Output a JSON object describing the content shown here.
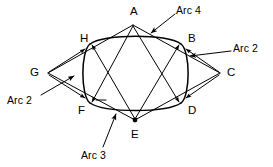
{
  "figure": {
    "kind": "geometric-construction-diagram",
    "stroke_color": "#000000",
    "background_color": "#ffffff",
    "line_width_px": 1
  },
  "points": [
    {
      "id": "A",
      "label": "A",
      "role": "rhombus-vertex-top",
      "x": 133,
      "y": 25,
      "label_x": 130,
      "label_y": 6,
      "dot": false
    },
    {
      "id": "B",
      "label": "B",
      "role": "tangent-point-upper-right",
      "x": 181,
      "y": 44,
      "label_x": 188,
      "label_y": 33,
      "dot": false
    },
    {
      "id": "C",
      "label": "C",
      "role": "rhombus-vertex-right",
      "x": 220,
      "y": 73,
      "label_x": 227,
      "label_y": 67,
      "dot": false
    },
    {
      "id": "D",
      "label": "D",
      "role": "tangent-point-lower-right",
      "x": 181,
      "y": 103,
      "label_x": 188,
      "label_y": 105,
      "dot": false
    },
    {
      "id": "E",
      "label": "E",
      "role": "arc-center-bottom",
      "x": 135,
      "y": 120,
      "label_x": 131,
      "label_y": 129,
      "dot": true
    },
    {
      "id": "F",
      "label": "F",
      "role": "tangent-point-lower-left",
      "x": 90,
      "y": 103,
      "label_x": 78,
      "label_y": 105,
      "dot": false
    },
    {
      "id": "G",
      "label": "G",
      "role": "rhombus-vertex-left",
      "x": 48,
      "y": 73,
      "label_x": 30,
      "label_y": 67,
      "dot": false
    },
    {
      "id": "H",
      "label": "H",
      "role": "tangent-point-upper-left",
      "x": 90,
      "y": 44,
      "label_x": 80,
      "label_y": 33,
      "dot": false
    }
  ],
  "arc_labels": [
    {
      "id": "arc4",
      "label": "Arc 4",
      "label_x": 176,
      "label_y": 5,
      "leader_from": [
        175,
        14
      ],
      "leader_to": [
        151,
        32
      ],
      "arrow": true
    },
    {
      "id": "arc2r",
      "label": "Arc 2",
      "label_x": 233,
      "label_y": 43,
      "leader_from": [
        231,
        52
      ],
      "leader_to": [
        190,
        55
      ],
      "arrow": true
    },
    {
      "id": "arc2l",
      "label": "Arc 2",
      "label_x": 7,
      "label_y": 95,
      "leader_from": [
        41,
        95
      ],
      "leader_to": [
        72,
        75
      ],
      "arrow": true
    },
    {
      "id": "arc3",
      "label": "Arc 3",
      "label_x": 81,
      "label_y": 150,
      "leader_from": [
        103,
        148
      ],
      "leader_to": [
        116,
        114
      ],
      "arrow": true
    }
  ],
  "ellipse": {
    "center_x": 136,
    "center_y": 73,
    "radius_x": 57,
    "radius_y": 39
  },
  "chord_lines": [
    {
      "id": "chord-H-D",
      "from": "H",
      "to": "D"
    },
    {
      "id": "chord-F-B",
      "from": "F",
      "to": "B"
    }
  ],
  "rhombus_edges": [
    {
      "id": "edge-G-A",
      "from": "G",
      "to": "A"
    },
    {
      "id": "edge-A-C",
      "from": "A",
      "to": "C"
    },
    {
      "id": "edge-C-E",
      "from": "C",
      "to": "E"
    },
    {
      "id": "edge-E-G",
      "from": "E",
      "to": "G"
    }
  ],
  "construction_rays": [
    {
      "id": "ray-A-F",
      "from": "A",
      "to": "F"
    },
    {
      "id": "ray-A-D",
      "from": "A",
      "to": "D"
    },
    {
      "id": "ray-E-H",
      "from": "E",
      "to": "H"
    },
    {
      "id": "ray-E-B",
      "from": "E",
      "to": "B"
    }
  ]
}
